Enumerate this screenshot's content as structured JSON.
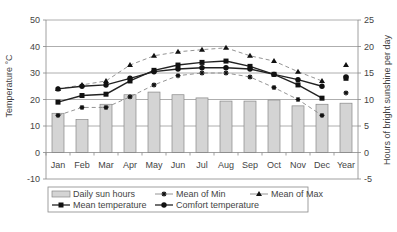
{
  "chart_data": {
    "type": "bar+line",
    "title": "",
    "categories": [
      "Jan",
      "Feb",
      "Mar",
      "Apr",
      "May",
      "Jun",
      "Jul",
      "Aug",
      "Sep",
      "Oct",
      "Nov",
      "Dec",
      "Year"
    ],
    "ylabel": "Temperature °C",
    "y2label": "Hours of bright sunshine per day",
    "ylim": [
      -10,
      50
    ],
    "y2lim": [
      -5,
      25
    ],
    "yticks": [
      50,
      40,
      30,
      20,
      10,
      0,
      -10
    ],
    "y2ticks": [
      25,
      20,
      15,
      10,
      5,
      0,
      -5
    ],
    "grid": true,
    "legend_position": "bottom",
    "series": [
      {
        "name": "Daily sun hours",
        "type": "bar",
        "axis": "right",
        "color": "#d4d4d4",
        "values": [
          7.4,
          6.2,
          9.1,
          10.9,
          11.4,
          10.9,
          10.3,
          9.7,
          9.7,
          9.9,
          8.8,
          9.1,
          9.3
        ]
      },
      {
        "name": "Mean of Min",
        "type": "line",
        "axis": "left",
        "marker": "star",
        "dash": true,
        "values": [
          14,
          17,
          17,
          21,
          25.5,
          29,
          30,
          30,
          28.5,
          24.5,
          20,
          14,
          22.5
        ]
      },
      {
        "name": "Mean of Max",
        "type": "line",
        "axis": "left",
        "marker": "triangle",
        "dash": true,
        "values": [
          24,
          25.5,
          27,
          33,
          36.5,
          38,
          38.8,
          39.5,
          36.5,
          34.5,
          30.5,
          27,
          33
        ]
      },
      {
        "name": "Mean temperature",
        "type": "line",
        "axis": "left",
        "marker": "square",
        "dash": false,
        "values": [
          19,
          21.5,
          22,
          27,
          31,
          33,
          34,
          34.5,
          32.5,
          29.5,
          25.5,
          20.5,
          28
        ]
      },
      {
        "name": "Comfort temperature",
        "type": "line",
        "axis": "left",
        "marker": "circle",
        "dash": false,
        "values": [
          24,
          25,
          25.5,
          28,
          30.5,
          31.5,
          32,
          32,
          31.5,
          29.5,
          27.5,
          25,
          28.5
        ]
      }
    ]
  },
  "legend": {
    "items": [
      "Daily sun hours",
      "Mean of Min",
      "Mean of Max",
      "Mean temperature",
      "Comfort temperature"
    ]
  },
  "axes": {
    "left_label": "Temperature °C",
    "right_label": "Hours of bright sunshine per day"
  }
}
